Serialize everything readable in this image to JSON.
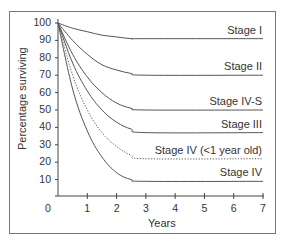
{
  "chart_data": {
    "type": "line",
    "title": "",
    "xlabel": "Years",
    "ylabel": "Percentage surviving",
    "xlim": [
      0,
      7
    ],
    "ylim": [
      0,
      100
    ],
    "x_ticks": [
      "0",
      "1",
      "2",
      "3",
      "4",
      "5",
      "6",
      "7"
    ],
    "y_ticks": [
      "10",
      "20",
      "30",
      "40",
      "50",
      "60",
      "70",
      "80",
      "90",
      "100"
    ],
    "grid": false,
    "legend": "inline labels at right end of each curve",
    "series": [
      {
        "name": "Stage I",
        "style": "solid",
        "x": [
          0,
          0.5,
          1,
          1.5,
          2,
          2.5,
          3,
          7
        ],
        "values": [
          100,
          97,
          95,
          93,
          92,
          91,
          91,
          91
        ]
      },
      {
        "name": "Stage II",
        "style": "solid",
        "x": [
          0,
          0.5,
          1,
          1.5,
          2,
          2.5,
          3,
          7
        ],
        "values": [
          100,
          90,
          82,
          76,
          73,
          71,
          70,
          70
        ]
      },
      {
        "name": "Stage IV-S",
        "style": "solid",
        "x": [
          0,
          0.5,
          1,
          1.5,
          2,
          2.5,
          3,
          7
        ],
        "values": [
          100,
          82,
          69,
          60,
          54,
          51,
          50,
          50
        ]
      },
      {
        "name": "Stage III",
        "style": "solid",
        "x": [
          0,
          0.5,
          1,
          1.5,
          2,
          2.5,
          3,
          7
        ],
        "values": [
          100,
          77,
          61,
          50,
          43,
          39,
          37,
          37
        ]
      },
      {
        "name": "Stage IV (<1 year old)",
        "style": "dotted",
        "x": [
          0,
          0.5,
          1,
          1.5,
          2,
          2.5,
          3,
          7
        ],
        "values": [
          100,
          70,
          50,
          37,
          29,
          24,
          22,
          22
        ]
      },
      {
        "name": "Stage IV",
        "style": "solid",
        "x": [
          0,
          0.5,
          1,
          1.5,
          2,
          2.5,
          3,
          7
        ],
        "values": [
          100,
          62,
          38,
          23,
          14,
          10,
          9,
          9
        ]
      }
    ]
  },
  "labels": {
    "stage_i": "Stage I",
    "stage_ii": "Stage II",
    "stage_ivs": "Stage IV-S",
    "stage_iii": "Stage III",
    "stage_iv_infant": "Stage IV (<1 year old)",
    "stage_iv": "Stage IV"
  },
  "colors": {
    "line": "#555555",
    "axis": "#444444",
    "frame": "#777777"
  }
}
